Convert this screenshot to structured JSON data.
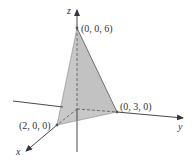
{
  "diagram": {
    "type": "3d-coordinate-tetrahedron",
    "axes": {
      "x_label": "x",
      "y_label": "y",
      "z_label": "z"
    },
    "points": {
      "z_intercept": "(0, 0, 6)",
      "y_intercept": "(0, 3, 0)",
      "x_intercept": "(2, 0, 0)"
    },
    "colors": {
      "face_fill": "#c8c8c8",
      "line": "#333333",
      "hidden_edge": "#555555"
    }
  }
}
